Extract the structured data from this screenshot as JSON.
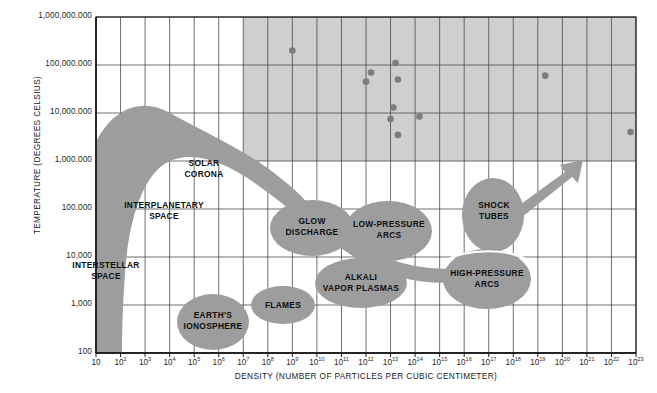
{
  "chart_data": {
    "type": "scatter",
    "title": "",
    "xlabel": "DENSITY (NUMBER OF PARTICLES PER CUBIC CENTIMETER)",
    "ylabel": "TEMPERATURE (DEGREES CELSIUS)",
    "xscale": "log",
    "yscale": "log",
    "xlim": [
      10,
      1e+23
    ],
    "ylim": [
      100,
      1000000000
    ],
    "grid": true,
    "legend": "none",
    "xticks": [
      {
        "label": "10",
        "exp": ""
      },
      {
        "label": "10",
        "exp": "2"
      },
      {
        "label": "10",
        "exp": "3"
      },
      {
        "label": "10",
        "exp": "4"
      },
      {
        "label": "10",
        "exp": "5"
      },
      {
        "label": "10",
        "exp": "6"
      },
      {
        "label": "10",
        "exp": "7"
      },
      {
        "label": "10",
        "exp": "8"
      },
      {
        "label": "10",
        "exp": "9"
      },
      {
        "label": "10",
        "exp": "10"
      },
      {
        "label": "10",
        "exp": "11"
      },
      {
        "label": "10",
        "exp": "12"
      },
      {
        "label": "10",
        "exp": "13"
      },
      {
        "label": "10",
        "exp": "14"
      },
      {
        "label": "10",
        "exp": "15"
      },
      {
        "label": "10",
        "exp": "16"
      },
      {
        "label": "10",
        "exp": "17"
      },
      {
        "label": "10",
        "exp": "18"
      },
      {
        "label": "10",
        "exp": "19"
      },
      {
        "label": "10",
        "exp": "20"
      },
      {
        "label": "10",
        "exp": "21"
      },
      {
        "label": "10",
        "exp": "22"
      },
      {
        "label": "10",
        "exp": "23"
      }
    ],
    "yticks": [
      "1,000,000,000",
      "100,000,000",
      "10,000,000",
      "1,000,000",
      "100,000",
      "10,000",
      "1,000",
      "100"
    ],
    "regions": [
      {
        "name": "INTERSTELLAR SPACE",
        "lines": [
          "INTERSTELLAR",
          "SPACE"
        ]
      },
      {
        "name": "INTERPLANETARY SPACE",
        "lines": [
          "INTERPLANETARY",
          "SPACE"
        ]
      },
      {
        "name": "SOLAR CORONA",
        "lines": [
          "SOLAR",
          "CORONA"
        ]
      },
      {
        "name": "EARTH'S IONOSPHERE",
        "lines": [
          "EARTH'S",
          "IONOSPHERE"
        ]
      },
      {
        "name": "FLAMES",
        "lines": [
          "FLAMES"
        ]
      },
      {
        "name": "GLOW DISCHARGE",
        "lines": [
          "GLOW",
          "DISCHARGE"
        ]
      },
      {
        "name": "LOW-PRESSURE ARCS",
        "lines": [
          "LOW-PRESSURE",
          "ARCS"
        ]
      },
      {
        "name": "ALKALI VAPOR PLASMAS",
        "lines": [
          "ALKALI",
          "VAPOR PLASMAS"
        ]
      },
      {
        "name": "SHOCK TUBES",
        "lines": [
          "SHOCK",
          "TUBES"
        ]
      },
      {
        "name": "HIGH-PRESSURE ARCS",
        "lines": [
          "HIGH-PRESSURE",
          "ARCS"
        ]
      }
    ],
    "shaded_zone": {
      "description": "Thermonuclear / fusion region (grey panel)",
      "x_range": [
        10000000.0,
        1e+23
      ],
      "y_range": [
        1000000,
        1000000000
      ]
    },
    "points": [
      {
        "x": 1000000000.0,
        "y": 200000000.0
      },
      {
        "x": 16000000000000.0,
        "y": 110000000.0
      },
      {
        "x": 20000000000000.0,
        "y": 50000000.0
      },
      {
        "x": 1000000000000.0,
        "y": 45000000.0
      },
      {
        "x": 1600000000000.0,
        "y": 70000000.0
      },
      {
        "x": 2e+19,
        "y": 60000000.0
      },
      {
        "x": 13000000000000.0,
        "y": 13000000.0
      },
      {
        "x": 10000000000000.0,
        "y": 7500000.0
      },
      {
        "x": 150000000000000.0,
        "y": 8500000.0
      },
      {
        "x": 20000000000000.0,
        "y": 3500000.0
      },
      {
        "x": 6e+22,
        "y": 4000000.0
      }
    ],
    "colors": {
      "region_fill": "#9d9d9d",
      "shaded_zone": "#cfcfcf",
      "point": "#7d7d7d",
      "grid": "#4a4a4a",
      "axis": "#1a1a1a",
      "background": "#ffffff",
      "text": "#111111"
    }
  }
}
